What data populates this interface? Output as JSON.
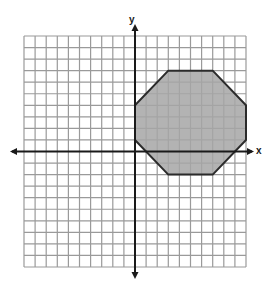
{
  "chart_data": {
    "type": "diagram",
    "title": "",
    "xlabel": "x",
    "ylabel": "y",
    "xlim": [
      -10,
      10
    ],
    "ylim": [
      -10,
      10
    ],
    "grid": true,
    "grid_step": 1,
    "tick_labels": false,
    "shapes": [
      {
        "kind": "polygon",
        "name": "octagon",
        "vertices": [
          [
            0,
            4
          ],
          [
            3,
            7
          ],
          [
            7,
            7
          ],
          [
            10,
            4
          ],
          [
            10,
            1
          ],
          [
            7,
            -2
          ],
          [
            3,
            -2
          ],
          [
            0,
            1
          ]
        ],
        "fill": "#a6a6a6",
        "stroke": "#2b2b2b"
      }
    ]
  },
  "labels": {
    "x_axis": "x",
    "y_axis": "y"
  },
  "colors": {
    "grid": "#9a9a9a",
    "axis": "#1a1a1a",
    "shape_fill": "#a6a6a6",
    "shape_stroke": "#2b2b2b",
    "background": "#ffffff"
  }
}
